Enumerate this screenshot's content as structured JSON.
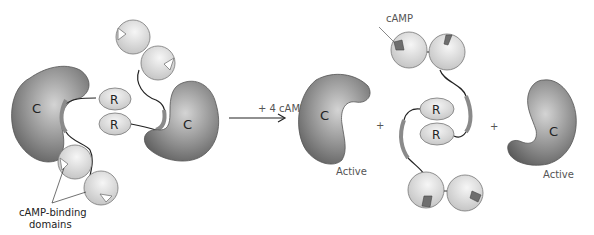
{
  "diagram": {
    "type": "reaction",
    "left_complex": {
      "catalytic_subunits": [
        {
          "label": "C"
        },
        {
          "label": "C"
        }
      ],
      "regulatory_subunits": [
        {
          "label": "R"
        },
        {
          "label": "R"
        }
      ],
      "annotation": {
        "line1": "cAMP-binding",
        "line2": "domains"
      }
    },
    "arrow": {
      "label": "+ 4 cAMP"
    },
    "products": {
      "catalytic_left": {
        "label": "C",
        "status": "Active"
      },
      "plus_1": "+",
      "regulatory_dimer": {
        "subunits": [
          {
            "label": "R"
          },
          {
            "label": "R"
          }
        ],
        "bound_label": "cAMP"
      },
      "plus_2": "+",
      "catalytic_right": {
        "label": "C",
        "status": "Active"
      }
    },
    "colors": {
      "catalytic_fill": "#7a7a7a",
      "regulatory_fill": "#dcdcdc",
      "domain_fill": "#e0e0e0",
      "camp_fill": "#6e6e6e",
      "linker": "#222222",
      "pseudosubstrate": "#8a8a8a"
    }
  }
}
